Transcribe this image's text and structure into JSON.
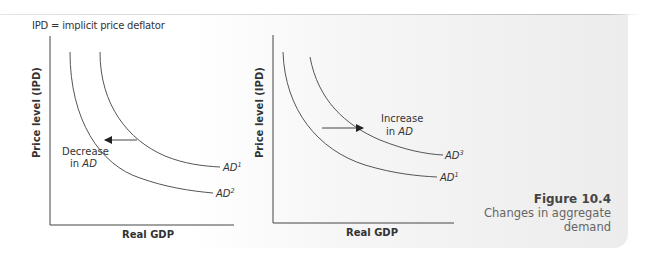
{
  "note": "IPD = implicit price deflator",
  "caption": {
    "figure_label": "Figure 10.4",
    "line1": "Changes in aggregate",
    "line2": "demand"
  },
  "left_chart": {
    "ylabel": "Price level (IPD)",
    "xlabel": "Real GDP",
    "curve_upper_label": "AD",
    "curve_upper_sup": "1",
    "curve_lower_label": "AD",
    "curve_lower_sup": "2",
    "shift_text_line1": "Decrease",
    "shift_text_line2_prefix": "in ",
    "shift_text_line2_em": "AD",
    "arrow_direction": "left"
  },
  "right_chart": {
    "ylabel": "Price level (IPD)",
    "xlabel": "Real GDP",
    "curve_upper_label": "AD",
    "curve_upper_sup": "3",
    "curve_lower_label": "AD",
    "curve_lower_sup": "1",
    "shift_text_line1": "Increase",
    "shift_text_line2_prefix": "in ",
    "shift_text_line2_em": "AD",
    "arrow_direction": "right"
  },
  "colors": {
    "line": "#555555",
    "text": "#333333",
    "caption": "#666666",
    "panel": "#efefef"
  }
}
